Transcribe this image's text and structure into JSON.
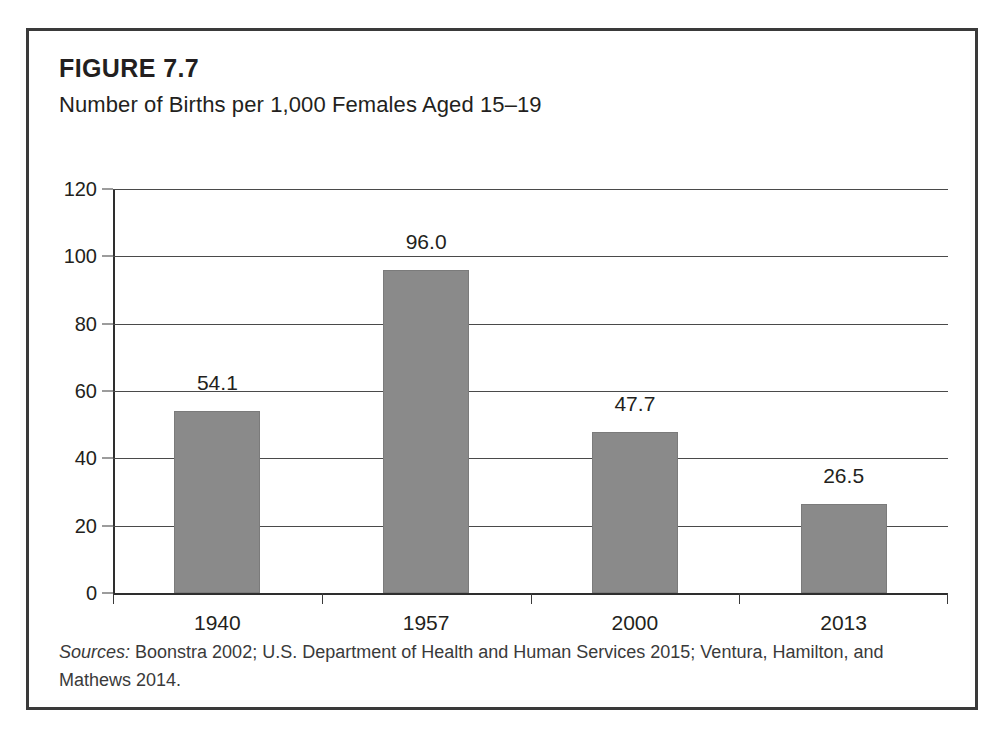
{
  "figure": {
    "number": "FIGURE 7.7",
    "subtitle": "Number of Births per 1,000 Females Aged 15–19",
    "sources_label": "Sources:",
    "sources_text": " Boonstra 2002; U.S. Department of Health and Human Services 2015; Ventura, Hamilton, and Mathews 2014."
  },
  "chart_data": {
    "type": "bar",
    "title": "Number of Births per 1,000 Females Aged 15–19",
    "xlabel": "",
    "ylabel": "",
    "categories": [
      "1940",
      "1957",
      "2000",
      "2013"
    ],
    "values": [
      54.1,
      96.0,
      47.7,
      26.5
    ],
    "value_labels": [
      "54.1",
      "96.0",
      "47.7",
      "26.5"
    ],
    "ylim": [
      0,
      120
    ],
    "yticks": [
      0,
      20,
      40,
      60,
      80,
      100,
      120
    ],
    "ytick_labels": [
      "0",
      "20",
      "40",
      "60",
      "80",
      "100",
      "120"
    ],
    "grid": true,
    "legend": "none",
    "bar_color": "#8a8a8a",
    "axis_color": "#2e2e2e"
  }
}
